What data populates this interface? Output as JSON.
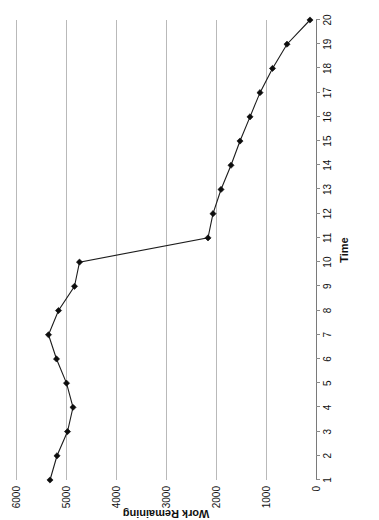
{
  "chart_data": {
    "type": "line",
    "title": "",
    "xlabel": "Time",
    "ylabel": "Work Remaining",
    "orientation": "rotated-90-ccw",
    "grid": true,
    "legend": false,
    "x": [
      1,
      2,
      3,
      4,
      5,
      6,
      7,
      8,
      9,
      10,
      11,
      12,
      13,
      14,
      15,
      16,
      17,
      18,
      19,
      20
    ],
    "xticklabels": [
      "1",
      "2",
      "3",
      "4",
      "5",
      "6",
      "7",
      "8",
      "9",
      "10",
      "11",
      "12",
      "13",
      "14",
      "15",
      "16",
      "17",
      "18",
      "19",
      "20"
    ],
    "xlim": [
      1,
      20
    ],
    "yticklabels": [
      "0",
      "1000",
      "2000",
      "3000",
      "4000",
      "5000",
      "6000"
    ],
    "yticks": [
      0,
      1000,
      2000,
      3000,
      4000,
      5000,
      6000
    ],
    "ylim": [
      0,
      6000
    ],
    "series": [
      {
        "name": "Work Remaining",
        "marker": "diamond",
        "color": "#111111",
        "values": [
          5320,
          5180,
          4970,
          4860,
          4990,
          5190,
          5350,
          5150,
          4830,
          4730,
          2160,
          2060,
          1900,
          1700,
          1520,
          1320,
          1120,
          870,
          580,
          120
        ]
      }
    ]
  },
  "axes": {
    "x_title": "Time",
    "y_title": "Work Remaining"
  }
}
